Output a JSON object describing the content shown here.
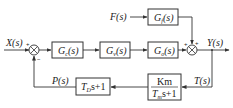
{
  "diagram": {
    "type": "control-block-diagram",
    "inputs": {
      "reference": "X(s)",
      "disturbance": "F(s)"
    },
    "output": "Y(s)",
    "signals": {
      "feedback_measured": "T(s)",
      "feedback_processed": "P(s)"
    },
    "forward_blocks": [
      {
        "id": "gc",
        "sym": "G",
        "sub": "c",
        "arg": "(s)"
      },
      {
        "id": "gv",
        "sym": "G",
        "sub": "v",
        "arg": "(s)"
      },
      {
        "id": "go",
        "sym": "G",
        "sub": "o",
        "arg": "(s)"
      }
    ],
    "disturbance_block": {
      "id": "gf",
      "sym": "G",
      "sub": "f",
      "arg": "(s)"
    },
    "feedback_blocks": [
      {
        "id": "sensor",
        "numerator": "Km",
        "denominator_pre": "T",
        "denominator_sub": "m",
        "denominator_post": "s+1"
      },
      {
        "id": "derivative",
        "pre": "T",
        "sub": "D",
        "post": "s+1"
      }
    ],
    "summing_junctions": [
      {
        "id": "sum1",
        "signs": [
          "+",
          "−"
        ]
      },
      {
        "id": "sum2",
        "signs": [
          "+",
          "+"
        ]
      }
    ],
    "colors": {
      "line": "#333333",
      "text": "#222222",
      "background": "#ffffff"
    }
  }
}
